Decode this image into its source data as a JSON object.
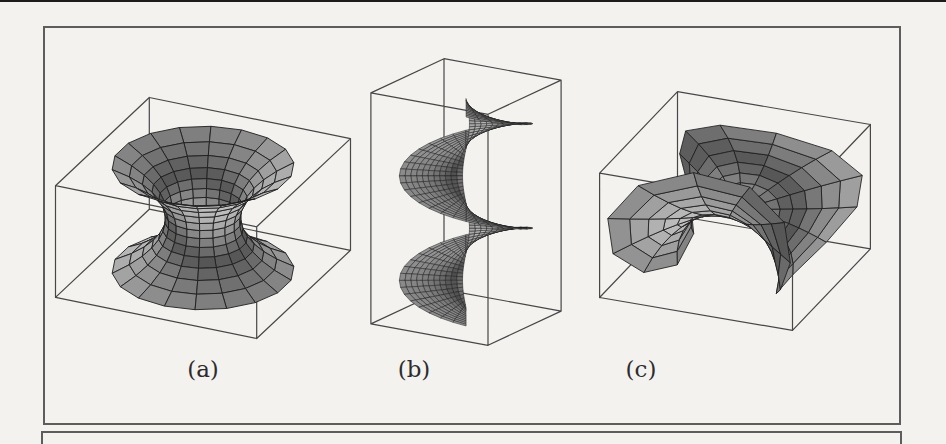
{
  "page": {
    "background": "#f3f2ef",
    "scan_bar_color": "#1c1c1c",
    "frame_border_color": "#5d5d5d"
  },
  "figure": {
    "light": [
      -0.4,
      -0.5,
      0.76
    ],
    "labels_top": 355,
    "panels": [
      {
        "id": "a",
        "label": "(a)",
        "surface_type": "catenoid",
        "label_center_x": 203,
        "render": {
          "left": 50,
          "top": 76,
          "width": 310,
          "height": 290,
          "view": {
            "az": 25,
            "el": 26,
            "s": 111,
            "cx": 153,
            "cy": 142
          },
          "box": {
            "hx": 1,
            "hy": 1,
            "hz": 0.56
          },
          "params": {
            "c": 0.34,
            "vmax": 0.52
          },
          "mesh": {
            "nu": 18,
            "nv": 13
          },
          "style": {
            "stroke": "#1e1e1e",
            "strokeWidth": 0.9,
            "boxStroke": "#474747",
            "boxWidth": 1.2,
            "g0": 0.33,
            "g1": 0.42
          }
        }
      },
      {
        "id": "b",
        "label": "(b)",
        "surface_type": "helicoid",
        "label_center_x": 414,
        "render": {
          "left": 366,
          "top": 50,
          "width": 212,
          "height": 300,
          "view": {
            "az": 32,
            "el": 17,
            "s": 115,
            "cx": 100,
            "cy": 152
          },
          "box": {
            "hx": 0.6,
            "hy": 0.6,
            "hz": 1.05
          },
          "params": {
            "v0": 0.03,
            "v1": 0.58,
            "turns": 2,
            "zmax": 0.95,
            "phase": 0.56
          },
          "mesh": {
            "nu": 64,
            "nv": 11
          },
          "style": {
            "stroke": "#1c1c1c",
            "strokeWidth": 0.5,
            "boxStroke": "#474747",
            "boxWidth": 1.2,
            "g0": 0.3,
            "g1": 0.42
          }
        }
      },
      {
        "id": "c",
        "label": "(c)",
        "surface_type": "enneper",
        "label_center_x": 641,
        "render": {
          "left": 588,
          "top": 80,
          "width": 300,
          "height": 270,
          "view": {
            "az": 22,
            "el": 25,
            "s": 104,
            "cx": 147,
            "cy": 131
          },
          "box": {
            "hx": 1,
            "hy": 1,
            "hz": 0.66
          },
          "params": {
            "rmax": 1.12,
            "sc": 0.85,
            "zs": 0.5,
            "rot": 0.38
          },
          "mesh": {
            "nu": 22,
            "nv": 9
          },
          "style": {
            "stroke": "#1e1e1e",
            "strokeWidth": 0.85,
            "boxStroke": "#474747",
            "boxWidth": 1.2,
            "g0": 0.33,
            "g1": 0.42
          }
        }
      }
    ]
  }
}
